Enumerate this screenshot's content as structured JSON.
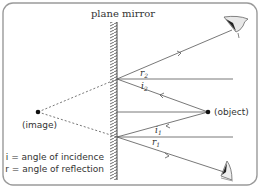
{
  "title": "plane mirror",
  "labels": {
    "image": "(image)",
    "object": "(object)",
    "i1": "i",
    "i1_sub": "1",
    "i2": "i",
    "i2_sub": "2",
    "r1": "r",
    "r1_sub": "1",
    "r2": "r",
    "r2_sub": "2"
  },
  "legend": {
    "incidence": "i = angle of incidence",
    "reflection": "r = angle of reflection"
  },
  "colors": {
    "line": "#555555",
    "frame": "#999999",
    "text": "#333333"
  }
}
